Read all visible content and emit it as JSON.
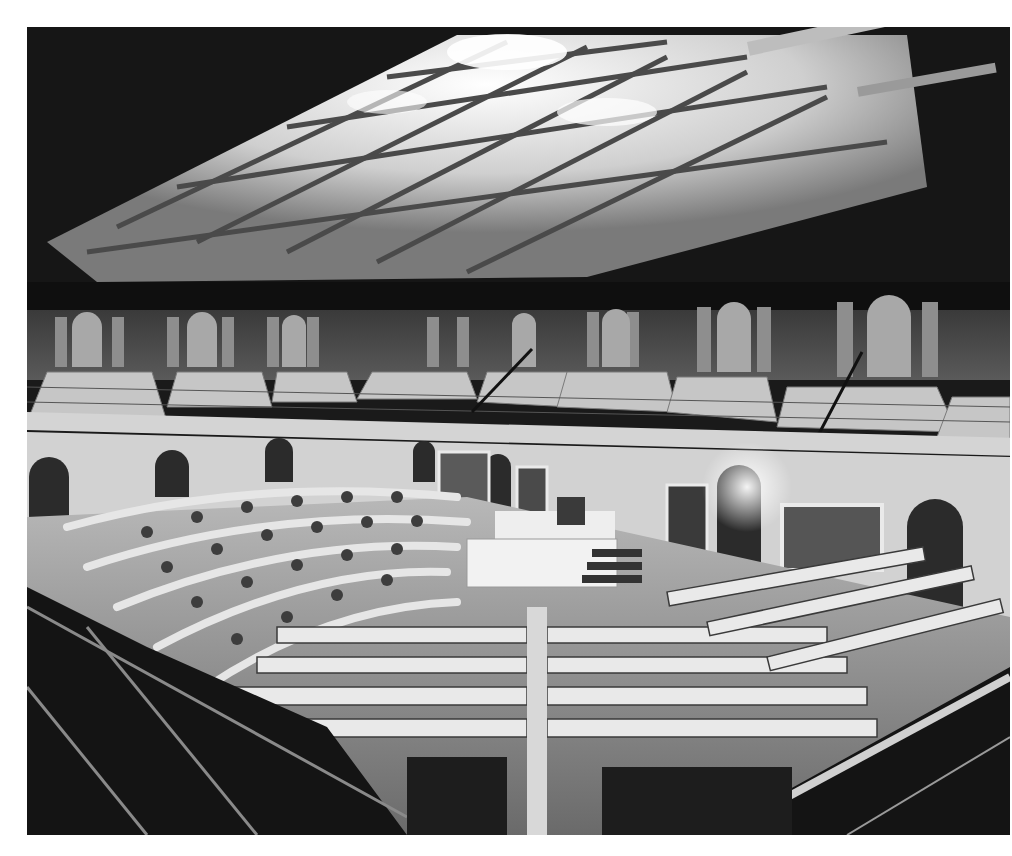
{
  "image": {
    "subject": "Historical black-and-white photograph of a legislative chamber interior",
    "alt": "Legislative chamber with skylit coffered ceiling, visitor galleries, semicircular rows of desks and chairs, and a central rostrum",
    "tones": {
      "background": "#ffffff",
      "dark": "#1a1a1a",
      "mid": "#6e6e6e",
      "light": "#d9d9d9",
      "highlight": "#f4f4f4"
    },
    "regions": [
      {
        "name": "skylight-ceiling",
        "description": "Glass-paneled coffered ceiling with bright skylights"
      },
      {
        "name": "gallery",
        "description": "Tiered bench seating in upper public galleries with arched doorways"
      },
      {
        "name": "wall-paintings",
        "description": "Framed portraits and landscape paintings on the lower walls"
      },
      {
        "name": "rostrum",
        "description": "Speaker's desk and clerk's platform at the center"
      },
      {
        "name": "floor-desks",
        "description": "Rows of desks and chairs arranged in a semicircle"
      },
      {
        "name": "foreground-railing",
        "description": "Gallery railing and stair rails in the dark foreground"
      }
    ]
  }
}
